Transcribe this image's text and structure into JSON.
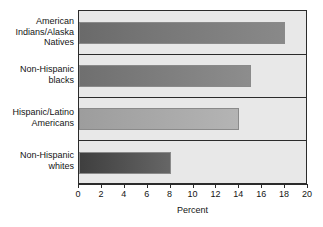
{
  "chart_data": {
    "type": "bar",
    "orientation": "horizontal",
    "title": "",
    "xlabel": "Percent",
    "ylabel": "",
    "xlim": [
      0,
      20
    ],
    "xticks": [
      0,
      2,
      4,
      6,
      8,
      10,
      12,
      14,
      16,
      18,
      20
    ],
    "xticklabels": [
      "0",
      "2",
      "4",
      "6",
      "8",
      "10",
      "12",
      "14",
      "16",
      "18",
      "20"
    ],
    "grid": false,
    "legend": null,
    "categories": [
      "American\nIndians/Alaska\nNatives",
      "Non-Hispanic\nblacks",
      "Hispanic/Latino\nAmericans",
      "Non-Hispanic\nwhites"
    ],
    "values": [
      18,
      15,
      14,
      8
    ],
    "bar_colors": [
      "#767676",
      "#7b7b7b",
      "#a6a6a6",
      "#4e4e4e"
    ],
    "plot_background": "#e8e8e8",
    "axis_color": "#2b2b2b",
    "text_color": "#141414"
  }
}
